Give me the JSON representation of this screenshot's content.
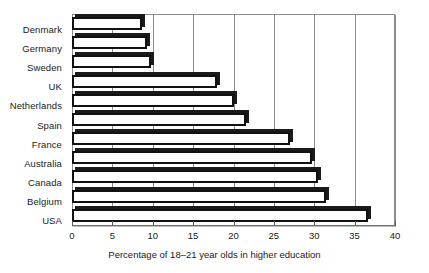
{
  "chart_data": {
    "type": "bar",
    "orientation": "horizontal",
    "title": "",
    "xlabel": "Percentage of 18–21 year olds in higher education",
    "ylabel": "",
    "xlim": [
      0,
      40
    ],
    "xticks": [
      0,
      5,
      10,
      15,
      20,
      25,
      30,
      35,
      40
    ],
    "xtick_labels": [
      "0",
      "5",
      "10",
      "15",
      "20",
      "25",
      "30",
      "35",
      "40"
    ],
    "grid": "vertical",
    "legend": "none",
    "categories": [
      "Denmark",
      "Germany",
      "Sweden",
      "UK",
      "Netherlands",
      "Spain",
      "France",
      "Australia",
      "Canada",
      "Belgium",
      "USA"
    ],
    "values": [
      8.7,
      9.3,
      9.8,
      18.0,
      20.0,
      21.5,
      27.0,
      29.7,
      30.5,
      31.5,
      36.7
    ],
    "bar_style": {
      "face_color": "#ffffff",
      "edge_color": "#111111",
      "shadow_color": "#1a1a1a",
      "effect": "3d-shadow"
    },
    "axis_color": "#8c8c8c",
    "background": "#ffffff"
  }
}
